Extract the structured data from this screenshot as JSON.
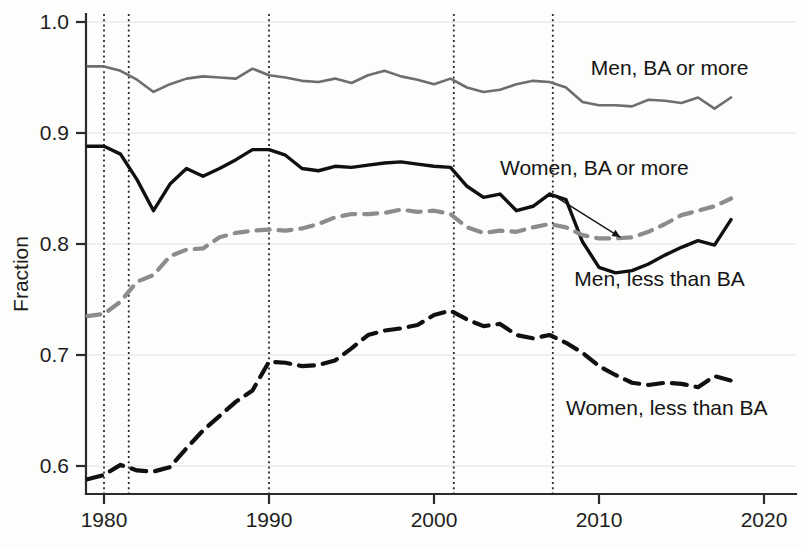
{
  "chart_data": {
    "type": "line",
    "title": "",
    "xlabel": "",
    "ylabel": "Fraction",
    "xlim": [
      1979,
      2020
    ],
    "ylim": [
      0.57,
      1.02
    ],
    "xticks": [
      1980,
      1990,
      2000,
      2010,
      2020
    ],
    "xtick_labels": [
      "1980",
      "1990",
      "2000",
      "2010",
      "2020"
    ],
    "yticks": [
      0.6,
      0.7,
      0.8,
      0.9,
      1.0
    ],
    "ytick_labels": [
      "0.6",
      "0.7",
      "0.8",
      "0.9",
      "1.0"
    ],
    "grid": true,
    "legend_position": "inline-annotations",
    "event_lines": [
      1980,
      1981.5,
      1990,
      2001.2,
      2007.2
    ],
    "x": [
      1979,
      1980,
      1981,
      1982,
      1983,
      1984,
      1985,
      1986,
      1987,
      1988,
      1989,
      1990,
      1991,
      1992,
      1993,
      1994,
      1995,
      1996,
      1997,
      1998,
      1999,
      2000,
      2001,
      2002,
      2003,
      2004,
      2005,
      2006,
      2007,
      2008,
      2009,
      2010,
      2011,
      2012,
      2013,
      2014,
      2015,
      2016,
      2017,
      2018
    ],
    "series": [
      {
        "name": "Men, BA or more",
        "color": "#6e6e6e",
        "style": "solid",
        "label_x": 2009.5,
        "label_y": 0.952,
        "values": [
          0.96,
          0.96,
          0.956,
          0.948,
          0.937,
          0.944,
          0.949,
          0.951,
          0.95,
          0.949,
          0.958,
          0.952,
          0.95,
          0.947,
          0.946,
          0.949,
          0.945,
          0.952,
          0.956,
          0.951,
          0.948,
          0.944,
          0.949,
          0.941,
          0.937,
          0.939,
          0.944,
          0.947,
          0.946,
          0.941,
          0.928,
          0.925,
          0.925,
          0.924,
          0.93,
          0.929,
          0.927,
          0.932,
          0.922,
          0.932
        ]
      },
      {
        "name": "Men, less than BA",
        "color": "#101010",
        "style": "solid",
        "label_x": 2008.5,
        "label_y": 0.762,
        "values": [
          0.888,
          0.888,
          0.881,
          0.858,
          0.83,
          0.854,
          0.868,
          0.861,
          0.868,
          0.876,
          0.885,
          0.885,
          0.88,
          0.868,
          0.866,
          0.87,
          0.869,
          0.871,
          0.873,
          0.874,
          0.872,
          0.87,
          0.869,
          0.852,
          0.842,
          0.845,
          0.83,
          0.834,
          0.845,
          0.84,
          0.802,
          0.779,
          0.774,
          0.776,
          0.782,
          0.79,
          0.797,
          0.803,
          0.799,
          0.822
        ]
      },
      {
        "name": "Women, BA or more",
        "color": "#8c8c8c",
        "style": "dashed",
        "label_x": 2004.0,
        "label_y": 0.862,
        "annotation_arrow_from": [
          2007.0,
          0.846
        ],
        "annotation_arrow_to": [
          2011.3,
          0.806
        ],
        "values": [
          0.735,
          0.737,
          0.748,
          0.766,
          0.772,
          0.789,
          0.795,
          0.796,
          0.806,
          0.81,
          0.812,
          0.813,
          0.812,
          0.814,
          0.818,
          0.824,
          0.827,
          0.827,
          0.828,
          0.831,
          0.829,
          0.83,
          0.827,
          0.815,
          0.81,
          0.812,
          0.811,
          0.815,
          0.818,
          0.815,
          0.808,
          0.805,
          0.805,
          0.806,
          0.811,
          0.818,
          0.826,
          0.83,
          0.834,
          0.841
        ]
      },
      {
        "name": "Women, less than BA",
        "color": "#101010",
        "style": "dashed",
        "label_x": 2008.0,
        "label_y": 0.646,
        "values": [
          0.588,
          0.592,
          0.601,
          0.596,
          0.595,
          0.599,
          0.616,
          0.632,
          0.645,
          0.658,
          0.668,
          0.694,
          0.693,
          0.69,
          0.691,
          0.695,
          0.706,
          0.718,
          0.722,
          0.724,
          0.727,
          0.736,
          0.74,
          0.732,
          0.726,
          0.728,
          0.718,
          0.715,
          0.718,
          0.711,
          0.702,
          0.69,
          0.682,
          0.675,
          0.673,
          0.675,
          0.674,
          0.671,
          0.681,
          0.677
        ]
      }
    ]
  },
  "axes": {
    "ylabel": "Fraction"
  }
}
